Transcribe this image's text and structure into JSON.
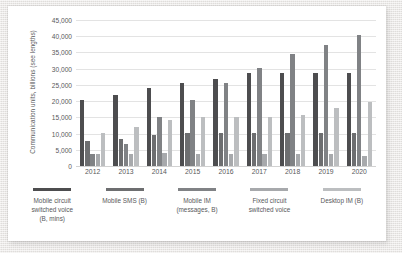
{
  "chart_data": {
    "type": "bar",
    "title": "",
    "subtitle": "",
    "xlabel": "",
    "ylabel": "Communication units, billions (see lengths)",
    "ylim": [
      0,
      45000
    ],
    "ytick_step": 5000,
    "yticks": [
      "0",
      "5,000",
      "10,000",
      "15,000",
      "20,000",
      "25,000",
      "30,000",
      "35,000",
      "40,000",
      "45,000"
    ],
    "grid": true,
    "legend_position": "bottom",
    "categories": [
      "2012",
      "2013",
      "2014",
      "2015",
      "2016",
      "2017",
      "2018",
      "2019",
      "2020"
    ],
    "series": [
      {
        "name": "Mobile circuit switched voice (B, mins)",
        "color": "#4d4d4f",
        "values": [
          20300,
          22000,
          23900,
          25500,
          26700,
          28700,
          28700,
          28700,
          28700
        ]
      },
      {
        "name": "Mobile SMS (B)",
        "color": "#6d6e70",
        "values": [
          7800,
          8200,
          9700,
          10200,
          10300,
          10300,
          10300,
          10300,
          10300
        ]
      },
      {
        "name": "Mobile IM (messages, B)",
        "color": "#808285",
        "values": [
          3700,
          6800,
          15000,
          20300,
          25500,
          30200,
          34600,
          37200,
          40300
        ]
      },
      {
        "name": "Fixed circuit switched voice",
        "color": "#a7a9ac",
        "values": [
          3700,
          3700,
          3900,
          3700,
          3800,
          3700,
          3700,
          3700,
          3200
        ]
      },
      {
        "name": "Desktop IM (B)",
        "color": "#bcbec0",
        "values": [
          10200,
          12100,
          14100,
          15100,
          15200,
          15200,
          15600,
          17800,
          19700
        ]
      }
    ]
  },
  "legend": {
    "entries": [
      {
        "label": "Mobile circuit\nswitched voice\n(B, mins)",
        "line1": "Mobile circuit",
        "line2": "switched voice",
        "line3": "(B, mins)",
        "color": "#4d4d4f"
      },
      {
        "label": "Mobile SMS (B)",
        "line1": "Mobile SMS (B)",
        "line2": "",
        "line3": "",
        "color": "#6d6e70"
      },
      {
        "label": "Mobile IM (messages, B)",
        "line1": "Mobile IM",
        "line2": "(messages, B)",
        "line3": "",
        "color": "#808285"
      },
      {
        "label": "Fixed circuit switched voice",
        "line1": "Fixed circuit",
        "line2": "switched voice",
        "line3": "",
        "color": "#a7a9ac"
      },
      {
        "label": "Desktop IM (B)",
        "line1": "Desktop IM (B)",
        "line2": "",
        "line3": "",
        "color": "#bcbec0"
      }
    ]
  },
  "theme": {
    "card_background": "#ffffff",
    "page_background": "#e9e7e4",
    "gridline_color": "#e3e3e3",
    "text_color": "#58595b"
  }
}
